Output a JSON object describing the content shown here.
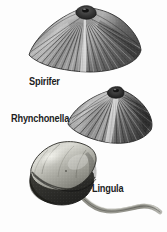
{
  "figure": {
    "background_color": "#fdfdfd",
    "width": 167,
    "height": 232,
    "style": "grayscale engraving / halftone scientific illustration",
    "label_color": "#1d1d1d"
  },
  "specimens": [
    {
      "id": "spirifer",
      "label": "Spirifer",
      "shape": "wide wing-shaped (alate) fan valve with radiating ribs from a central dark beak",
      "label_position": {
        "x": 29,
        "y": 77
      },
      "tones": {
        "highlight": "#e6e6e6",
        "midtone": "#9a9a9a",
        "shadow": "#4a4a4a",
        "outline": "#2b2b2b"
      }
    },
    {
      "id": "rhynchonella",
      "label": "Rhynchonella",
      "shape": "triangular-fan valve with strong radiating plications and a pointed umbo at top",
      "label_position": {
        "x": 11,
        "y": 114
      },
      "tones": {
        "highlight": "#dedede",
        "midtone": "#8f8f8f",
        "shadow": "#454545",
        "outline": "#272727"
      }
    },
    {
      "id": "lingula",
      "label": "Lingula",
      "shape": "smooth tongue-shaped oval shell tilted left with a long tapering curved pedicle to the lower right",
      "label_position": {
        "x": 92,
        "y": 184
      },
      "tones": {
        "highlight": "#dcdcd6",
        "midtone": "#a2a29a",
        "shadow": "#3a3a38",
        "outline": "#242422",
        "pedicle": "#7d7d78"
      }
    }
  ]
}
